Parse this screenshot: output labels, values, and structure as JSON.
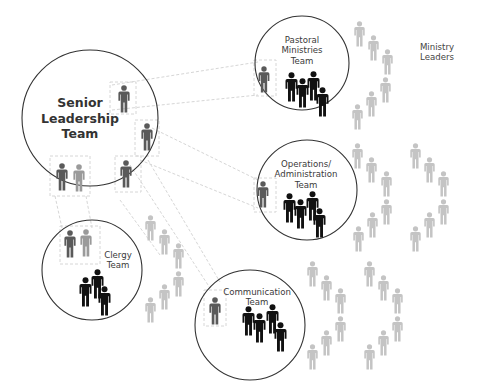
{
  "diagram": {
    "colors": {
      "circle_stroke": "#333333",
      "connector": "#d6d6d6",
      "leader_figure": "#5a5a5a",
      "leader_figure_light": "#9a9a9a",
      "team_figure": "#111111",
      "ministry_leader_figure": "#c4c4c4",
      "text": "#3a3a3a"
    },
    "teams": [
      {
        "id": "senior-leadership",
        "label_lines": [
          "Senior",
          "Leadership",
          "Team"
        ],
        "cx": 90,
        "cy": 118,
        "r": 68
      },
      {
        "id": "pastoral-ministries",
        "label_lines": [
          "Pastoral",
          "Ministries",
          "Team"
        ],
        "cx": 302,
        "cy": 63,
        "r": 47
      },
      {
        "id": "operations-administration",
        "label_lines": [
          "Operations/",
          "Administration",
          "Team"
        ],
        "cx": 307,
        "cy": 190,
        "r": 50
      },
      {
        "id": "clergy",
        "label_lines": [
          "Clergy",
          "Team"
        ],
        "cx": 92,
        "cy": 270,
        "r": 50
      },
      {
        "id": "communication",
        "label_lines": [
          "Communication",
          "Team"
        ],
        "cx": 250,
        "cy": 325,
        "r": 55
      }
    ],
    "side_label": {
      "lines": [
        "Ministry",
        "Leaders"
      ]
    }
  }
}
